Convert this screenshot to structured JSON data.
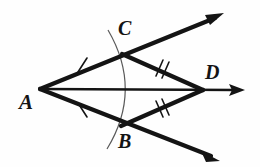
{
  "figure": {
    "kind": "geometry-diagram",
    "background_color": "#fefefe",
    "ink_color": "#141414",
    "arc_color": "#555555",
    "labels": [
      {
        "id": "A",
        "text": "A",
        "x": 19,
        "y": 92,
        "role": "vertex-label"
      },
      {
        "id": "B",
        "text": "B",
        "x": 118,
        "y": 131,
        "role": "vertex-label"
      },
      {
        "id": "C",
        "text": "C",
        "x": 118,
        "y": 18,
        "role": "vertex-label"
      },
      {
        "id": "D",
        "text": "D",
        "x": 205,
        "y": 62,
        "role": "vertex-label"
      }
    ],
    "points": {
      "A": {
        "x": 40,
        "y": 89
      },
      "B": {
        "x": 121,
        "y": 126
      },
      "C": {
        "x": 122,
        "y": 54
      },
      "D": {
        "x": 203,
        "y": 90
      }
    },
    "rays": [
      {
        "name": "ray-AC",
        "from": "A",
        "through": "C",
        "tip_x": 224,
        "tip_y": 13,
        "weight": "thick"
      },
      {
        "name": "ray-AD",
        "through": "D",
        "from": "A",
        "tip_x": 245,
        "tip_y": 90,
        "weight": "thin"
      },
      {
        "name": "ray-AB",
        "from": "A",
        "through": "B",
        "tip_x": 220,
        "tip_y": 161,
        "weight": "thick"
      }
    ],
    "segments": [
      {
        "name": "segment-AC",
        "from": "A",
        "to": "C",
        "ticks": 1
      },
      {
        "name": "segment-AB",
        "from": "A",
        "to": "B",
        "ticks": 1
      },
      {
        "name": "segment-CD",
        "from": "C",
        "to": "D",
        "ticks": 2
      },
      {
        "name": "segment-BD",
        "from": "B",
        "to": "D",
        "ticks": 2
      },
      {
        "name": "segment-AD",
        "from": "A",
        "to": "D",
        "ticks": 0
      }
    ],
    "tick_marks": [
      {
        "name": "tick-AC-single",
        "x": 82,
        "y": 65,
        "count": 1
      },
      {
        "name": "tick-AB-single",
        "x": 82,
        "y": 110,
        "count": 1
      },
      {
        "name": "tick-CD-double",
        "x": 161,
        "y": 68,
        "count": 2
      },
      {
        "name": "tick-BD-double",
        "x": 161,
        "y": 109,
        "count": 2
      }
    ],
    "arc": {
      "name": "construction-arc-CB",
      "start_x": 108,
      "start_y": 30,
      "end_x": 107,
      "end_y": 149,
      "bulge_x": 143,
      "bulge_y": 90
    }
  }
}
